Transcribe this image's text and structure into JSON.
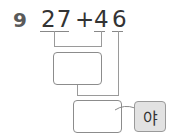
{
  "problem": {
    "number": "9",
    "operand1": "27",
    "operator": "+",
    "operand2_tens": "4",
    "operand2_ones": "6"
  },
  "step_boxes": [
    {
      "label": "intermediate-sum-box",
      "value": ""
    },
    {
      "label": "final-answer-box",
      "value": ""
    }
  ],
  "suffix": "야",
  "colors": {
    "line": "#9a9a9a",
    "suffix_fill": "#e2e2e2",
    "text": "#333333"
  }
}
